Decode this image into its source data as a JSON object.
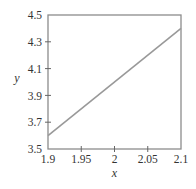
{
  "chart_data": {
    "type": "line",
    "title": "",
    "xlabel": "x",
    "ylabel": "y",
    "xlim": [
      1.9,
      2.1
    ],
    "ylim": [
      3.5,
      4.5
    ],
    "x_ticks": [
      "1.9",
      "1.95",
      "2",
      "2.05",
      "2.1"
    ],
    "y_ticks": [
      "3.5",
      "3.7",
      "3.9",
      "4.1",
      "4.3",
      "4.5"
    ],
    "grid": false,
    "legend": null,
    "series": [
      {
        "name": "y = 4x - 4",
        "x": [
          1.9,
          2.1
        ],
        "y": [
          3.6,
          4.4
        ],
        "color": "#999999"
      }
    ]
  },
  "colors": {
    "axis": "#888888",
    "line": "#999999",
    "text": "#333333"
  }
}
